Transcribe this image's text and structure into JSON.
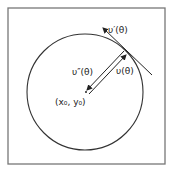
{
  "diagram": {
    "frame": {
      "x": 8,
      "y": 8,
      "width": 157,
      "height": 156,
      "stroke": "#777777"
    },
    "circle": {
      "cx": 85,
      "cy": 92,
      "r": 58,
      "stroke": "#333333"
    },
    "center_point": {
      "x": 86,
      "y": 92
    },
    "tangent_point": {
      "x": 127,
      "y": 52
    },
    "tangent_line": {
      "x1": 102,
      "y1": 27,
      "x2": 152,
      "y2": 75
    },
    "labels": {
      "tangent_vector": "υ′(θ)",
      "normal_vector": "υ″(θ)",
      "position_vector": "υ(θ)",
      "center": "(x₀, y₀)"
    },
    "colors": {
      "line": "#222222",
      "background": "#ffffff"
    }
  }
}
